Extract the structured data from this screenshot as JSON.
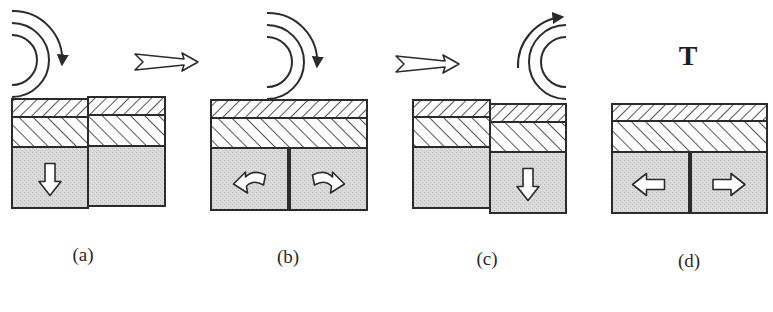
{
  "figure": {
    "panels": [
      {
        "id": "a",
        "label": "(a)",
        "label_x": 83,
        "label_y": 244,
        "roller": {
          "visible": true,
          "cx": 12,
          "cy": 60,
          "direction": "clockwise",
          "side": "left"
        },
        "blocks": [
          {
            "x": 12,
            "top": 99,
            "w": 76,
            "l1": 18,
            "l2": 30,
            "bottom": 208,
            "arrow": "down"
          },
          {
            "x": 88,
            "top": 97,
            "w": 77,
            "l1": 18,
            "l2": 31,
            "bottom": 206,
            "arrow": "none"
          }
        ]
      },
      {
        "id": "b",
        "label": "(b)",
        "label_x": 288,
        "label_y": 246,
        "roller": {
          "visible": true,
          "cx": 267,
          "cy": 62,
          "direction": "clockwise",
          "side": "left"
        },
        "blocks": [
          {
            "x": 211,
            "top": 100,
            "w": 77,
            "l1": 18,
            "l2": 30,
            "bottom": 210,
            "arrow": "curve-left"
          },
          {
            "x": 290,
            "top": 100,
            "w": 77,
            "l1": 18,
            "l2": 30,
            "bottom": 210,
            "arrow": "curve-right"
          }
        ],
        "joined_top": true
      },
      {
        "id": "c",
        "label": "(c)",
        "label_x": 487,
        "label_y": 248,
        "roller": {
          "visible": true,
          "cx": 566,
          "cy": 62,
          "direction": "clockwise",
          "side": "right"
        },
        "blocks": [
          {
            "x": 413,
            "top": 100,
            "w": 77,
            "l1": 17,
            "l2": 30,
            "bottom": 208,
            "arrow": "none"
          },
          {
            "x": 490,
            "top": 104,
            "w": 76,
            "l1": 18,
            "l2": 30,
            "bottom": 213,
            "arrow": "down"
          }
        ]
      },
      {
        "id": "d",
        "label": "(d)",
        "label_x": 689,
        "label_y": 250,
        "roller": {
          "visible": false
        },
        "top_text": "T",
        "blocks": [
          {
            "x": 612,
            "top": 104,
            "w": 77,
            "l1": 17,
            "l2": 31,
            "bottom": 213,
            "arrow": "left"
          },
          {
            "x": 691,
            "top": 104,
            "w": 76,
            "l1": 17,
            "l2": 31,
            "bottom": 213,
            "arrow": "right"
          }
        ],
        "joined_top": true
      }
    ],
    "transition_arrows": [
      {
        "x1": 135,
        "x2": 198,
        "y": 62
      },
      {
        "x1": 396,
        "x2": 459,
        "y": 64
      }
    ],
    "colors": {
      "stroke": "#2b2b2b",
      "fill_gray": "#d8d8d8",
      "background": "#ffffff"
    }
  }
}
